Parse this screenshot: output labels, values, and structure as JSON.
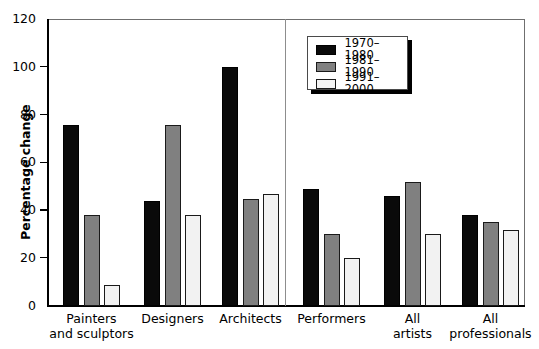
{
  "chart_data": {
    "type": "bar",
    "title": "",
    "xlabel": "",
    "ylabel": "Percentage change",
    "ylim": [
      0,
      120
    ],
    "yticks": [
      0,
      20,
      40,
      60,
      80,
      100,
      120
    ],
    "ytick_labels": [
      "0",
      "20",
      "40",
      "60",
      "80",
      "100",
      "120"
    ],
    "grid": false,
    "legend_position": "top-center-right",
    "categories": [
      "Painters\nand sculptors",
      "Designers",
      "Architects",
      "Performers",
      "All\nartists",
      "All\nprofessionals"
    ],
    "series": [
      {
        "name": "1970–1980",
        "color": "#0a0a0a",
        "values": [
          76,
          44,
          100,
          49,
          46,
          38
        ]
      },
      {
        "name": "1981–1990",
        "color": "#808080",
        "values": [
          38,
          76,
          45,
          30,
          52,
          35
        ]
      },
      {
        "name": "1991–2000",
        "color": "#f2f2f2",
        "values": [
          9,
          38,
          47,
          20,
          30,
          32
        ]
      }
    ],
    "annotations": [
      {
        "type": "vertical-divider",
        "after_category": "Architects"
      }
    ]
  },
  "legend": {
    "entries": [
      {
        "label": "1970–1980",
        "swatch": "black"
      },
      {
        "label": "1981–1990",
        "swatch": "gray"
      },
      {
        "label": "1991–2000",
        "swatch": "white"
      }
    ]
  },
  "axis": {
    "y_title": "Percentage change",
    "y_labels": [
      "120",
      "100",
      "80",
      "60",
      "40",
      "20",
      "0"
    ]
  },
  "colors": {
    "series_1": "#0a0a0a",
    "series_2": "#808080",
    "series_3": "#f2f2f2",
    "frame": "#6f6f6f",
    "divider": "#8d8d8d",
    "background": "#ffffff"
  }
}
